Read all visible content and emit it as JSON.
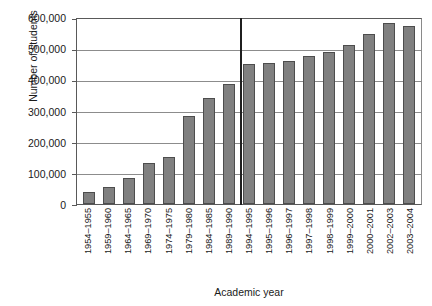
{
  "chart_data": {
    "type": "bar",
    "title": "",
    "xlabel": "Academic year",
    "ylabel": "Number of students",
    "ylim": [
      0,
      600000
    ],
    "ytick_labels": [
      "600,000",
      "500,000",
      "400,000",
      "300,000",
      "200,000",
      "100,000",
      "0"
    ],
    "ytick_values": [
      600000,
      500000,
      400000,
      300000,
      200000,
      100000,
      0
    ],
    "grid": true,
    "legend": "none",
    "categories": [
      "1954–1955",
      "1959–1960",
      "1964–1965",
      "1969–1970",
      "1974–1975",
      "1979–1980",
      "1984–1985",
      "1989–1990",
      "1994–1995",
      "1995–1996",
      "1996–1997",
      "1997–1998",
      "1998–1999",
      "1999–2000",
      "2000–2001",
      "2002–2003",
      "2003–2004"
    ],
    "values": [
      38000,
      55000,
      82000,
      133000,
      152000,
      283000,
      340000,
      385000,
      448000,
      452000,
      458000,
      475000,
      488000,
      510000,
      545000,
      582000,
      572000
    ],
    "annotations": [
      {
        "type": "vertical-divider",
        "after_category": "1989–1990"
      }
    ],
    "series_color": "#808080",
    "bar_edge_color": "#4d4d4d",
    "axis_color": "#595959",
    "grid_color": "#8c8c8c"
  }
}
